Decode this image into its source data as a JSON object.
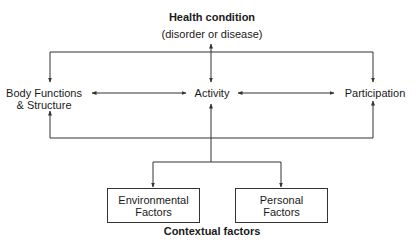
{
  "diagram": {
    "health_condition": {
      "title": "Health condition",
      "subtitle": "(disorder or disease)"
    },
    "nodes": {
      "body": {
        "line1": "Body Functions",
        "line2": "& Structure"
      },
      "activity": {
        "label": "Activity"
      },
      "participation": {
        "label": "Participation"
      }
    },
    "contextual": {
      "environmental": {
        "line1": "Environmental",
        "line2": "Factors"
      },
      "personal": {
        "line1": "Personal",
        "line2": "Factors"
      },
      "caption": "Contextual factors"
    },
    "colors": {
      "line": "#333333",
      "text": "#1a1a1a",
      "background": "#ffffff"
    }
  }
}
